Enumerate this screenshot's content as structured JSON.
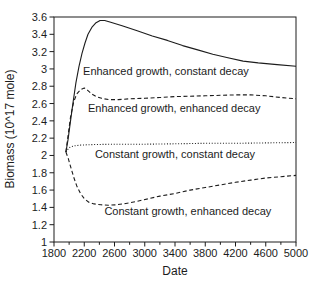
{
  "figure": {
    "background": "#ffffff",
    "line_color": "#1c1c1c",
    "text_color": "#1c1c1c"
  },
  "chart_data": {
    "type": "line",
    "title": "",
    "xlabel": "Date",
    "ylabel": "Biomass (10^17 mole)",
    "xlim": [
      1800,
      5000
    ],
    "ylim": [
      1,
      3.6
    ],
    "grid": false,
    "legend_position": "inline-annotations",
    "x_major_tick_step": 400,
    "x_minor_tick_step": 200,
    "y_tick_step": 0.2,
    "x_tick_labels": [
      "1800",
      "2200",
      "2600",
      "3000",
      "3400",
      "3800",
      "4200",
      "4600",
      "5000"
    ],
    "y_tick_labels": [
      "1",
      "1.2",
      "1.4",
      "1.6",
      "1.8",
      "2",
      "2.2",
      "2.4",
      "2.6",
      "2.8",
      "3",
      "3.2",
      "3.4",
      "3.6"
    ],
    "series": [
      {
        "name": "Enhanced growth, constant decay",
        "line_style": "solid",
        "points": [
          [
            1958,
            2.04
          ],
          [
            1985,
            2.18
          ],
          [
            2015,
            2.38
          ],
          [
            2050,
            2.6
          ],
          [
            2090,
            2.84
          ],
          [
            2130,
            3.03
          ],
          [
            2170,
            3.18
          ],
          [
            2210,
            3.3
          ],
          [
            2250,
            3.4
          ],
          [
            2300,
            3.48
          ],
          [
            2350,
            3.53
          ],
          [
            2410,
            3.56
          ],
          [
            2470,
            3.56
          ],
          [
            2550,
            3.54
          ],
          [
            2700,
            3.5
          ],
          [
            2900,
            3.44
          ],
          [
            3100,
            3.38
          ],
          [
            3300,
            3.33
          ],
          [
            3500,
            3.27
          ],
          [
            3700,
            3.22
          ],
          [
            3900,
            3.17
          ],
          [
            4100,
            3.13
          ],
          [
            4300,
            3.09
          ],
          [
            4500,
            3.07
          ],
          [
            4750,
            3.05
          ],
          [
            5000,
            3.03
          ]
        ]
      },
      {
        "name": "Enhanced growth, enhanced decay",
        "line_style": "dashed",
        "points": [
          [
            1958,
            2.04
          ],
          [
            1990,
            2.26
          ],
          [
            2020,
            2.45
          ],
          [
            2060,
            2.62
          ],
          [
            2100,
            2.71
          ],
          [
            2150,
            2.76
          ],
          [
            2200,
            2.78
          ],
          [
            2250,
            2.75
          ],
          [
            2300,
            2.71
          ],
          [
            2360,
            2.68
          ],
          [
            2430,
            2.66
          ],
          [
            2520,
            2.645
          ],
          [
            2650,
            2.645
          ],
          [
            2800,
            2.655
          ],
          [
            3000,
            2.66
          ],
          [
            3200,
            2.67
          ],
          [
            3400,
            2.68
          ],
          [
            3600,
            2.685
          ],
          [
            3800,
            2.69
          ],
          [
            4000,
            2.695
          ],
          [
            4200,
            2.7
          ],
          [
            4400,
            2.7
          ],
          [
            4600,
            2.69
          ],
          [
            4800,
            2.67
          ],
          [
            5000,
            2.655
          ]
        ]
      },
      {
        "name": "Constant growth, constant decay",
        "line_style": "dotted",
        "points": [
          [
            1958,
            2.04
          ],
          [
            2000,
            2.09
          ],
          [
            2060,
            2.11
          ],
          [
            2150,
            2.12
          ],
          [
            2300,
            2.125
          ],
          [
            2600,
            2.13
          ],
          [
            3000,
            2.13
          ],
          [
            3400,
            2.135
          ],
          [
            3800,
            2.14
          ],
          [
            4200,
            2.14
          ],
          [
            4600,
            2.145
          ],
          [
            5000,
            2.15
          ]
        ]
      },
      {
        "name": "Constant growth, enhanced decay",
        "line_style": "dashed",
        "points": [
          [
            1958,
            2.04
          ],
          [
            1990,
            1.96
          ],
          [
            2020,
            1.87
          ],
          [
            2060,
            1.75
          ],
          [
            2100,
            1.65
          ],
          [
            2150,
            1.56
          ],
          [
            2200,
            1.5
          ],
          [
            2260,
            1.46
          ],
          [
            2330,
            1.44
          ],
          [
            2420,
            1.43
          ],
          [
            2520,
            1.425
          ],
          [
            2620,
            1.43
          ],
          [
            2750,
            1.445
          ],
          [
            2900,
            1.47
          ],
          [
            3050,
            1.5
          ],
          [
            3200,
            1.53
          ],
          [
            3400,
            1.56
          ],
          [
            3600,
            1.6
          ],
          [
            3800,
            1.63
          ],
          [
            4000,
            1.66
          ],
          [
            4200,
            1.69
          ],
          [
            4400,
            1.715
          ],
          [
            4600,
            1.74
          ],
          [
            4800,
            1.755
          ],
          [
            5000,
            1.77
          ]
        ]
      }
    ],
    "annotations": [
      {
        "text": "Enhanced growth, constant decay",
        "x": 3280,
        "y": 2.98
      },
      {
        "text": "Enhanced growth, enhanced decay",
        "x": 3390,
        "y": 2.55
      },
      {
        "text": "Constant growth, constant decay",
        "x": 3400,
        "y": 2.02
      },
      {
        "text": "Constant growth, enhanced decay",
        "x": 3570,
        "y": 1.36
      }
    ]
  }
}
